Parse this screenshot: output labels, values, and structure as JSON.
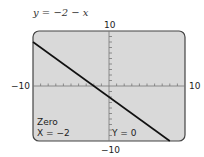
{
  "chart_data": {
    "type": "line",
    "title": "y = −2 − x",
    "equation": "y = -2 - x",
    "xlim": [
      -10,
      10
    ],
    "ylim": [
      -10,
      10
    ],
    "x_tick_labels": {
      "min": "−10",
      "max": "10"
    },
    "y_tick_labels": {
      "min": "−10",
      "max": "10"
    },
    "grid": false,
    "x_tick_step": 1,
    "y_tick_step": 1,
    "series": [
      {
        "name": "y = -2 - x",
        "x": [
          -10,
          8
        ],
        "y": [
          8,
          -10
        ],
        "color": "#111111"
      }
    ],
    "annotations": {
      "mode": "Zero",
      "x_readout": "X = −2",
      "y_readout": "Y = 0"
    }
  },
  "screen": {
    "background": "#d9d9d9",
    "border_color": "#444444"
  }
}
